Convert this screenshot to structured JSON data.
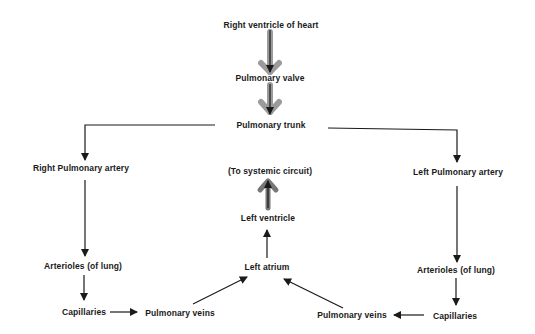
{
  "diagram": {
    "type": "flowchart",
    "nodes": {
      "right_ventricle": {
        "label": "Right ventricle of heart"
      },
      "pulmonary_valve": {
        "label": "Pulmonary valve"
      },
      "pulmonary_trunk": {
        "label": "Pulmonary trunk"
      },
      "right_pulmonary_artery": {
        "label": "Right Pulmonary artery"
      },
      "left_pulmonary_artery": {
        "label": "Left Pulmonary artery"
      },
      "arterioles_right": {
        "label": "Arterioles (of lung)"
      },
      "arterioles_left": {
        "label": "Arterioles (of lung)"
      },
      "capillaries_right": {
        "label": "Capillaries"
      },
      "capillaries_left": {
        "label": "Capillaries"
      },
      "pulmonary_veins_right": {
        "label": "Pulmonary veins"
      },
      "pulmonary_veins_left": {
        "label": "Pulmonary veins"
      },
      "left_atrium": {
        "label": "Left atrium"
      },
      "left_ventricle": {
        "label": "Left ventricle"
      },
      "systemic_circuit": {
        "label": "(To systemic circuit)"
      }
    },
    "edges": [
      [
        "right_ventricle",
        "pulmonary_valve"
      ],
      [
        "pulmonary_valve",
        "pulmonary_trunk"
      ],
      [
        "pulmonary_trunk",
        "right_pulmonary_artery"
      ],
      [
        "pulmonary_trunk",
        "left_pulmonary_artery"
      ],
      [
        "right_pulmonary_artery",
        "arterioles_right"
      ],
      [
        "arterioles_right",
        "capillaries_right"
      ],
      [
        "capillaries_right",
        "pulmonary_veins_right"
      ],
      [
        "pulmonary_veins_right",
        "left_atrium"
      ],
      [
        "left_pulmonary_artery",
        "arterioles_left"
      ],
      [
        "arterioles_left",
        "capillaries_left"
      ],
      [
        "capillaries_left",
        "pulmonary_veins_left"
      ],
      [
        "pulmonary_veins_left",
        "left_atrium"
      ],
      [
        "left_atrium",
        "left_ventricle"
      ],
      [
        "left_ventricle",
        "systemic_circuit"
      ]
    ],
    "colors": {
      "line": "#1a1a1a",
      "highlight_arrow": "#8a8a8a"
    }
  }
}
